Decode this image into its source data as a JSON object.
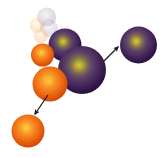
{
  "figure": {
    "background_color": "#ffffff",
    "width": 168,
    "height": 158
  },
  "palette": {
    "purple_highlight": "#c8bc3a",
    "purple_mid": "#5c3c72",
    "purple_dark": "#2a1038",
    "purple_edge": "#1d0a28",
    "orange_highlight": "#ffc63a",
    "orange_mid": "#f07a12",
    "orange_dark": "#d4470a",
    "orange_edge": "#b03404",
    "arrow_color": "#1a1a1a",
    "ghost_purple": "#b9a8c8",
    "ghost_orange": "#f6c89a"
  },
  "legend": {
    "purple_label": "purple atom",
    "orange_label": "orange atom",
    "ghost_label": "ghost (previous position)",
    "arrow_label": "dissociation direction"
  },
  "atoms": [
    {
      "id": "ghost-purple-top",
      "element": "purple",
      "cx": 46.5,
      "cy": 17.0,
      "r": 9.5,
      "state": "ghost",
      "opacity": 0.42
    },
    {
      "id": "ghost-orange-upper",
      "element": "orange",
      "cx": 37.0,
      "cy": 25.5,
      "r": 7.5,
      "state": "ghost",
      "opacity": 0.4
    },
    {
      "id": "ghost-purple-mid",
      "element": "purple",
      "cx": 49.0,
      "cy": 28.0,
      "r": 9.0,
      "state": "ghost",
      "opacity": 0.34
    },
    {
      "id": "ghost-orange-lower",
      "element": "orange",
      "cx": 41.0,
      "cy": 36.0,
      "r": 7.0,
      "state": "ghost",
      "opacity": 0.45
    },
    {
      "id": "purple-upper",
      "element": "purple",
      "cx": 65.0,
      "cy": 45.0,
      "r": 16.5,
      "state": "solid",
      "opacity": 1
    },
    {
      "id": "orange-upper",
      "element": "orange",
      "cx": 42.5,
      "cy": 55.0,
      "r": 11.5,
      "state": "solid",
      "opacity": 1
    },
    {
      "id": "purple-large",
      "element": "purple",
      "cx": 82.0,
      "cy": 70.0,
      "r": 24.0,
      "state": "solid",
      "opacity": 1
    },
    {
      "id": "orange-large",
      "element": "orange",
      "cx": 50.0,
      "cy": 84.0,
      "r": 17.5,
      "state": "solid",
      "opacity": 1
    },
    {
      "id": "purple-detached",
      "element": "purple",
      "cx": 138.5,
      "cy": 45.0,
      "r": 18.5,
      "state": "solid",
      "opacity": 1
    },
    {
      "id": "orange-detached",
      "element": "orange",
      "cx": 28.0,
      "cy": 131.0,
      "r": 16.5,
      "state": "solid",
      "opacity": 1
    }
  ],
  "arrows": [
    {
      "id": "arrow-purple-right",
      "label": "purple atom leaving toward the right",
      "x1": 104.0,
      "y1": 61.0,
      "x2": 118.0,
      "y2": 47.0
    },
    {
      "id": "arrow-orange-down-left",
      "label": "orange atom leaving toward the lower left",
      "x1": 48.0,
      "y1": 95.0,
      "x2": 35.0,
      "y2": 114.0
    }
  ]
}
